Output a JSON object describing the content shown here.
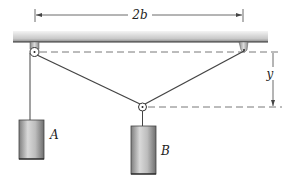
{
  "figure": {
    "type": "mechanics pulley system diagram",
    "labels": {
      "width_dimension": "2b",
      "height_dimension": "y",
      "block_a": "A",
      "block_b": "B"
    },
    "colors": {
      "line": "#444444",
      "ceiling_top": "#f2f2f2",
      "ceiling_bottom": "#8a8a8a",
      "block_light": "#d8d8d8",
      "block_dark": "#7a7a7a",
      "dashed": "#555555"
    }
  }
}
